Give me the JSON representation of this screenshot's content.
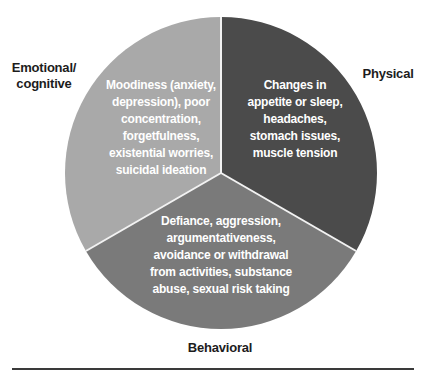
{
  "diagram": {
    "type": "pie-diagram",
    "center": {
      "x": 221,
      "y": 173
    },
    "radius": 156,
    "divider_color": "#f2f2f2",
    "segments": [
      {
        "id": "emotional",
        "label": "Emotional/\ncognitive",
        "color": "#a9a9a9",
        "text": "Moodiness (anxiety,\ndepression), poor\nconcentration,\nforgetfulness,\nexistential worries,\nsuicidal ideation"
      },
      {
        "id": "physical",
        "label": "Physical",
        "color": "#4b4b4b",
        "text": "Changes in\nappetite or sleep,\nheadaches,\nstomach issues,\nmuscle tension"
      },
      {
        "id": "behavioral",
        "label": "Behavioral",
        "color": "#7a7a7a",
        "text": "Defiance, aggression,\nargumentativeness,\navoidance or withdrawal\nfrom activities, substance\nabuse, sexual risk taking"
      }
    ]
  }
}
